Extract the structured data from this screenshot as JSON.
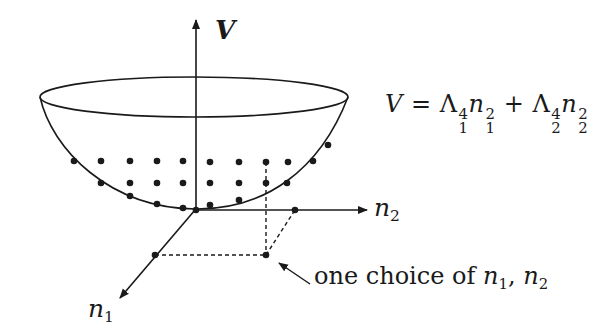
{
  "figure": {
    "axes": {
      "vertical": {
        "label": "V"
      },
      "horizontal": {
        "label": "n",
        "label_sub": "2"
      },
      "depth": {
        "label": "n",
        "label_sub": "1"
      }
    },
    "formula": {
      "lhs": "V",
      "eq": "=",
      "term1": {
        "base": "Λ",
        "sup": "4",
        "sub": "1",
        "var": "n",
        "var_sup": "2",
        "var_sub": "1"
      },
      "plus": "+",
      "term2": {
        "base": "Λ",
        "sup": "4",
        "sub": "2",
        "var": "n",
        "var_sup": "2",
        "var_sub": "2"
      }
    },
    "annotation": {
      "text": "one choice of ",
      "var1": "n",
      "var1_sub": "1",
      "sep": ", ",
      "var2": "n",
      "var2_sub": "2"
    },
    "colors": {
      "ink": "#1a1a1a",
      "background": "#ffffff"
    },
    "lattice_points": [
      [
        74,
        161
      ],
      [
        101,
        161
      ],
      [
        130,
        161
      ],
      [
        157,
        161
      ],
      [
        183,
        161
      ],
      [
        210,
        162
      ],
      [
        239,
        162
      ],
      [
        266,
        162
      ],
      [
        288,
        162
      ],
      [
        313,
        161
      ],
      [
        101,
        183
      ],
      [
        130,
        183
      ],
      [
        157,
        183
      ],
      [
        183,
        183
      ],
      [
        210,
        183
      ],
      [
        239,
        183
      ],
      [
        266,
        183
      ],
      [
        287,
        183
      ],
      [
        130,
        196
      ],
      [
        157,
        204
      ],
      [
        183,
        208
      ],
      [
        210,
        205
      ],
      [
        239,
        200
      ],
      [
        328,
        145
      ]
    ]
  }
}
